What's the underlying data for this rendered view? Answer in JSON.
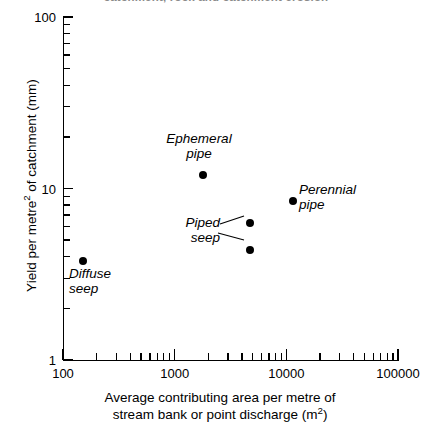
{
  "figure": {
    "clipped_top_text": "catchment, rock and catchment erosion"
  },
  "chart_data": {
    "type": "scatter",
    "title": "",
    "xlabel": "Average contributing area per metre of stream bank or point discharge (m²)",
    "xlabel_line1": "Average contributing area per metre of",
    "xlabel_line2_pre": "stream bank or point discharge (m",
    "xlabel_line2_sup": "2",
    "xlabel_line2_post": ")",
    "ylabel": "Yield per metre² of catchment (mm)",
    "ylabel_pre": "Yield per metre",
    "ylabel_sup": "2",
    "ylabel_post": " of catchment (mm)",
    "xscale": "log",
    "yscale": "log",
    "xlim": [
      100,
      100000
    ],
    "ylim": [
      1,
      100
    ],
    "grid": false,
    "legend": "none",
    "marker_color": "#000000",
    "xticks": [
      {
        "value": 100,
        "label": "100"
      },
      {
        "value": 1000,
        "label": "1000"
      },
      {
        "value": 10000,
        "label": "10000"
      },
      {
        "value": 100000,
        "label": "100000"
      }
    ],
    "yticks": [
      {
        "value": 1,
        "label": "1"
      },
      {
        "value": 10,
        "label": "10"
      },
      {
        "value": 100,
        "label": "100"
      }
    ],
    "points": [
      {
        "name": "Diffuse seep",
        "x": 150,
        "y": 3.8,
        "label": "Diffuse\nseep",
        "label_line1": "Diffuse",
        "label_line2": "seep"
      },
      {
        "name": "Ephemeral pipe",
        "x": 1800,
        "y": 12.0,
        "label": "Ephemeral\npipe",
        "label_line1": "Ephemeral",
        "label_line2": "pipe"
      },
      {
        "name": "Piped seep (upper)",
        "x": 4700,
        "y": 6.3,
        "label": "Piped\nseep",
        "label_line1": "Piped",
        "label_line2": "seep"
      },
      {
        "name": "Piped seep (lower)",
        "x": 4700,
        "y": 4.4,
        "label": "",
        "label_line1": "",
        "label_line2": ""
      },
      {
        "name": "Perennial pipe",
        "x": 11500,
        "y": 8.5,
        "label": "Perennial\npipe",
        "label_line1": "Perennial",
        "label_line2": "pipe"
      }
    ],
    "annotations": [
      {
        "name": "ephemeral-pipe-label",
        "line1": "Ephemeral",
        "line2": "pipe"
      },
      {
        "name": "perennial-pipe-label",
        "line1": "Perennial",
        "line2": "pipe"
      },
      {
        "name": "piped-seep-label",
        "line1": "Piped",
        "line2": "seep"
      },
      {
        "name": "diffuse-seep-label",
        "line1": "Diffuse",
        "line2": "seep"
      }
    ]
  }
}
